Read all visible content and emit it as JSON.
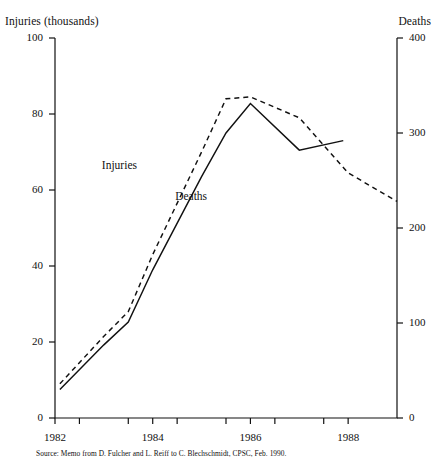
{
  "chart_data": {
    "type": "line",
    "title": "",
    "xlabel": "",
    "ylabel": "Injuries (thousands)",
    "y2label": "Deaths",
    "xlim": [
      1982,
      1989
    ],
    "ylim": [
      0,
      100
    ],
    "y2lim": [
      0,
      400
    ],
    "grid": false,
    "legend": "inline-labels",
    "x_tick_labels": [
      "1982",
      "1984",
      "1986",
      "1988"
    ],
    "x_tick_values": [
      1982,
      1984,
      1986,
      1988
    ],
    "x_minor_ticks": [
      1982.5,
      1983.5,
      1984.5,
      1985.5,
      1986.5,
      1987.5
    ],
    "y_tick_labels": [
      "0",
      "20",
      "40",
      "60",
      "80",
      "100"
    ],
    "y_tick_values": [
      0,
      20,
      40,
      60,
      80,
      100
    ],
    "y2_tick_labels": [
      "0",
      "100",
      "200",
      "300",
      "400"
    ],
    "y2_tick_values": [
      0,
      100,
      200,
      300,
      400
    ],
    "series": [
      {
        "name": "Injuries",
        "axis": "left",
        "style": "dashed",
        "units": "thousands",
        "x": [
          1982.1,
          1983.0,
          1983.5,
          1984.0,
          1985.0,
          1985.5,
          1986.0,
          1987.0,
          1988.0,
          1989.0
        ],
        "values": [
          9.0,
          21.5,
          28.0,
          43.0,
          70.0,
          84.0,
          84.5,
          79.0,
          64.5,
          57.0
        ]
      },
      {
        "name": "Deaths",
        "axis": "right",
        "style": "solid",
        "units": "count",
        "x": [
          1982.1,
          1983.0,
          1983.5,
          1984.0,
          1985.0,
          1985.5,
          1986.0,
          1987.0,
          1987.9
        ],
        "values": [
          30,
          77,
          101,
          156,
          254,
          300,
          331,
          282,
          292
        ]
      }
    ],
    "annotations": [
      {
        "text": "Injuries",
        "x": 1983.0,
        "y": 66
      },
      {
        "text": "Deaths",
        "x": 1984.5,
        "y": 58
      }
    ]
  },
  "labels": {
    "left_axis_title": "Injuries (thousands)",
    "right_axis_title": "Deaths",
    "series_injuries": "Injuries",
    "series_deaths": "Deaths"
  },
  "source": {
    "note": "Source: Memo from D. Fulcher and L. Reiff to C. Blechschmidt, CPSC, Feb. 1990."
  },
  "colors": {
    "ink": "#111111",
    "background": "#ffffff"
  }
}
